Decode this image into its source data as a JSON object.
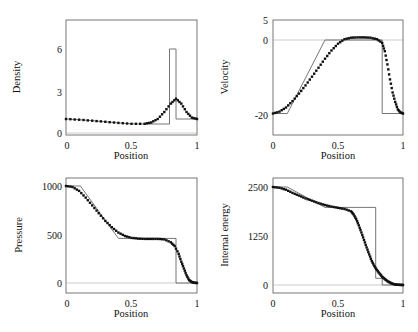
{
  "chart_data": [
    {
      "type": "line",
      "title": "",
      "xlabel": "Position",
      "ylabel": "Density",
      "xlim": [
        0,
        1
      ],
      "ylim": [
        0,
        8
      ],
      "xticks": [
        "0",
        "0.5",
        "1"
      ],
      "yticks": [
        "0",
        "3",
        "6"
      ],
      "series": [
        {
          "name": "exact",
          "style": "solid line",
          "x": [
            0,
            0.1,
            0.2,
            0.3,
            0.4,
            0.5,
            0.6,
            0.7,
            0.79,
            0.79,
            0.84,
            0.84,
            1.0
          ],
          "y": [
            1.0,
            0.95,
            0.88,
            0.8,
            0.72,
            0.66,
            0.64,
            0.64,
            0.64,
            6.0,
            6.0,
            1.0,
            1.0
          ]
        },
        {
          "name": "numerical",
          "style": "dots",
          "x": [
            0,
            0.1,
            0.2,
            0.3,
            0.4,
            0.5,
            0.6,
            0.65,
            0.7,
            0.75,
            0.8,
            0.84,
            0.88,
            0.92,
            0.96,
            1.0
          ],
          "y": [
            1.0,
            0.95,
            0.88,
            0.8,
            0.72,
            0.66,
            0.66,
            0.75,
            1.0,
            1.5,
            2.1,
            2.45,
            2.1,
            1.5,
            1.1,
            1.0
          ]
        }
      ]
    },
    {
      "type": "line",
      "title": "",
      "xlabel": "Position",
      "ylabel": "Velocity",
      "xlim": [
        0,
        1
      ],
      "ylim": [
        -25,
        5
      ],
      "xticks": [
        "0",
        "0.5",
        "1"
      ],
      "yticks": [
        "-20",
        "0",
        "5"
      ],
      "series": [
        {
          "name": "exact",
          "style": "solid line",
          "x": [
            0,
            0.11,
            0.4,
            0.84,
            0.84,
            1.0
          ],
          "y": [
            -19.6,
            -19.6,
            0,
            0,
            -19.6,
            -19.6
          ]
        },
        {
          "name": "numerical",
          "style": "dots",
          "x": [
            0,
            0.05,
            0.1,
            0.15,
            0.2,
            0.25,
            0.3,
            0.35,
            0.4,
            0.45,
            0.5,
            0.55,
            0.6,
            0.65,
            0.7,
            0.75,
            0.8,
            0.84,
            0.86,
            0.88,
            0.9,
            0.92,
            0.94,
            0.96,
            0.98,
            1.0
          ],
          "y": [
            -19.6,
            -19.1,
            -18.0,
            -16.3,
            -14.3,
            -12.1,
            -9.8,
            -7.4,
            -5.0,
            -2.8,
            -1.0,
            0.2,
            0.6,
            0.7,
            0.7,
            0.6,
            0.2,
            -0.8,
            -3.0,
            -6.5,
            -10.5,
            -14.0,
            -16.5,
            -18.5,
            -19.3,
            -19.6
          ]
        }
      ]
    },
    {
      "type": "line",
      "title": "",
      "xlabel": "Position",
      "ylabel": "Pressure",
      "xlim": [
        0,
        1
      ],
      "ylim": [
        -100,
        1100
      ],
      "xticks": [
        "0",
        "0.5",
        "1"
      ],
      "yticks": [
        "0",
        "500",
        "1000"
      ],
      "series": [
        {
          "name": "exact",
          "style": "solid line",
          "x": [
            0,
            0.11,
            0.4,
            0.84,
            0.84,
            1.0
          ],
          "y": [
            1000,
            1000,
            460,
            460,
            0.01,
            0.01
          ]
        },
        {
          "name": "numerical",
          "style": "dots",
          "x": [
            0,
            0.05,
            0.1,
            0.15,
            0.2,
            0.25,
            0.3,
            0.35,
            0.4,
            0.45,
            0.5,
            0.55,
            0.6,
            0.65,
            0.7,
            0.75,
            0.8,
            0.83,
            0.86,
            0.88,
            0.9,
            0.92,
            0.94,
            0.96,
            0.98,
            1.0
          ],
          "y": [
            1000,
            990,
            950,
            880,
            800,
            720,
            640,
            575,
            520,
            485,
            465,
            458,
            455,
            455,
            455,
            450,
            420,
            380,
            300,
            220,
            150,
            80,
            30,
            10,
            2,
            0
          ]
        }
      ]
    },
    {
      "type": "line",
      "title": "",
      "xlabel": "Position",
      "ylabel": "Internal energy",
      "xlim": [
        0,
        1
      ],
      "ylim": [
        -250,
        2750
      ],
      "xticks": [
        "0",
        "0.5",
        "1"
      ],
      "yticks": [
        "0",
        "1250",
        "2500"
      ],
      "series": [
        {
          "name": "exact",
          "style": "solid line",
          "x": [
            0,
            0.11,
            0.4,
            0.79,
            0.79,
            0.84,
            0.84,
            1.0
          ],
          "y": [
            2500,
            2500,
            1980,
            1980,
            170,
            170,
            0,
            0
          ]
        },
        {
          "name": "numerical",
          "style": "dots",
          "x": [
            0,
            0.05,
            0.1,
            0.15,
            0.2,
            0.25,
            0.3,
            0.35,
            0.4,
            0.45,
            0.5,
            0.55,
            0.6,
            0.62,
            0.64,
            0.66,
            0.68,
            0.7,
            0.72,
            0.74,
            0.76,
            0.78,
            0.8,
            0.82,
            0.84,
            0.86,
            0.88,
            0.9,
            0.92,
            0.94,
            0.96,
            0.98,
            1.0
          ],
          "y": [
            2500,
            2480,
            2430,
            2350,
            2280,
            2210,
            2150,
            2090,
            2040,
            2000,
            1970,
            1940,
            1880,
            1800,
            1680,
            1520,
            1340,
            1150,
            960,
            780,
            610,
            480,
            380,
            290,
            210,
            150,
            100,
            60,
            30,
            15,
            5,
            2,
            0
          ]
        }
      ]
    }
  ],
  "panels": [
    {
      "ylabel": "Density",
      "xlabel": "Position",
      "yticks": [
        "0",
        "3",
        "6"
      ],
      "xticks": [
        "0",
        "0.5",
        "1"
      ]
    },
    {
      "ylabel": "Velocity",
      "xlabel": "Position",
      "yticks": [
        "-20",
        "0",
        "5"
      ],
      "xticks": [
        "0",
        "0.5",
        "1"
      ]
    },
    {
      "ylabel": "Pressure",
      "xlabel": "Position",
      "yticks": [
        "0",
        "500",
        "1000"
      ],
      "xticks": [
        "0",
        "0.5",
        "1"
      ]
    },
    {
      "ylabel": "Internal energy",
      "xlabel": "Position",
      "yticks": [
        "0",
        "1250",
        "2500"
      ],
      "xticks": [
        "0",
        "0.5",
        "1"
      ]
    }
  ]
}
